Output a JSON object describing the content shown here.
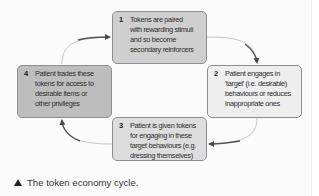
{
  "diagram": {
    "type": "cycle",
    "steps": [
      {
        "number": "1",
        "text": "Tokens are paired\nwith rewarding stimuli\nand so become\nsecondary reinforcers",
        "fill": "#cfcfcf"
      },
      {
        "number": "2",
        "text": "Patient engages in\n'target' (i.e. desirable)\nbehaviours or reduces\ninappropriate ones",
        "fill": "#eeeeee"
      },
      {
        "number": "3",
        "text": "Patient is given tokens\nfor engaging in these\ntarget behaviours (e.g.\ndressing themselves)",
        "fill": "#dddddd"
      },
      {
        "number": "4",
        "text": "Patient trades these\ntokens for access to\ndesirable items or\nother privileges",
        "fill": "#bdbdbd"
      }
    ],
    "arrows": [
      {
        "from": "1",
        "to": "2"
      },
      {
        "from": "2",
        "to": "3"
      },
      {
        "from": "3",
        "to": "4"
      },
      {
        "from": "4",
        "to": "1"
      }
    ],
    "arrow_color": "#555555",
    "border_color": "#8d8d8d"
  },
  "caption": {
    "icon": "triangle-up-icon",
    "text": "The token economy cycle."
  }
}
